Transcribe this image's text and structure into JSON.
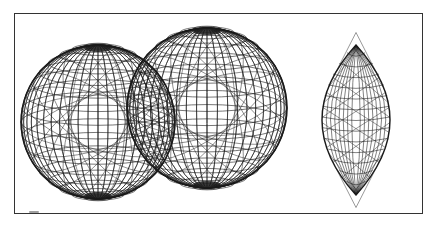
{
  "diagram": {
    "frame": {
      "x": 14,
      "y": 13,
      "w": 409,
      "h": 201,
      "stroke": "#333333"
    },
    "line_color": "#1a1a1a",
    "shapes": [
      {
        "id": "sphere-left",
        "type": "wireframe-sphere",
        "cx": 98,
        "cy": 122,
        "r": 77,
        "latitudes": 18,
        "meridians": 24
      },
      {
        "id": "sphere-right",
        "type": "wireframe-sphere",
        "cx": 207,
        "cy": 108,
        "r": 80,
        "latitudes": 18,
        "meridians": 24
      },
      {
        "id": "intersection-lens",
        "type": "wireframe-lens",
        "cx": 356,
        "cy": 120,
        "rx": 34,
        "ry": 75
      }
    ]
  }
}
